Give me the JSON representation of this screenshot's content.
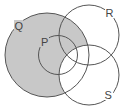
{
  "diagram": {
    "type": "venn",
    "sets": [
      {
        "id": "Q",
        "label": "Q",
        "cx": 47,
        "cy": 55,
        "r": 42
      },
      {
        "id": "P",
        "label": "P",
        "cx": 58,
        "cy": 55,
        "r": 19.5
      },
      {
        "id": "R",
        "label": "R",
        "cx": 89,
        "cy": 35,
        "r": 30
      },
      {
        "id": "S",
        "label": "S",
        "cx": 89,
        "cy": 75,
        "r": 30
      }
    ],
    "shaded_region": "Q minus S",
    "colors": {
      "shade": "#c8c8c8",
      "stroke": "#555555",
      "background": "#ffffff"
    },
    "labels": {
      "Q": "Q",
      "P": "P",
      "R": "R",
      "S": "S"
    }
  }
}
